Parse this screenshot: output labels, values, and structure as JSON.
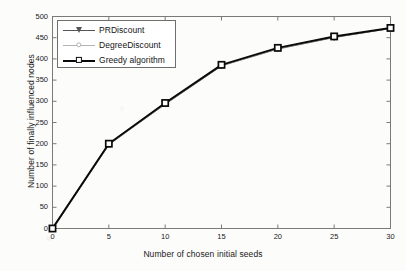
{
  "chart_data": {
    "type": "line",
    "title": "",
    "xlabel": "Number of chosen initial seeds",
    "ylabel": "Number of finally influenced nodes",
    "x": [
      0,
      5,
      10,
      15,
      20,
      25,
      30
    ],
    "xlim": [
      0,
      30
    ],
    "ylim": [
      0,
      500
    ],
    "xticks": [
      "0",
      "5",
      "10",
      "15",
      "20",
      "25",
      "30"
    ],
    "yticks": [
      "0",
      "50",
      "100",
      "150",
      "200",
      "250",
      "300",
      "350",
      "400",
      "450",
      "500"
    ],
    "grid": false,
    "legend_position": "upper-left",
    "series": [
      {
        "name": "PRDiscount",
        "marker": "triangle-down",
        "color": "#555555",
        "values": [
          0,
          199,
          294,
          384,
          424,
          451,
          472
        ]
      },
      {
        "name": "DegreeDiscount",
        "marker": "circle",
        "color": "#b3b3b3",
        "values": [
          0,
          198,
          295,
          385,
          425,
          452,
          472
        ]
      },
      {
        "name": "Greedy algorithm",
        "marker": "square",
        "color": "#0a0a0a",
        "values": [
          0,
          200,
          296,
          386,
          426,
          453,
          473
        ]
      }
    ]
  },
  "axes": {
    "frame_color": "#7a7a7a",
    "tick_color": "#7a7a7a"
  },
  "legend": {
    "entries": [
      {
        "label": "PRDiscount",
        "marker": "triangle-down-icon"
      },
      {
        "label": "DegreeDiscount",
        "marker": "circle-icon"
      },
      {
        "label": "Greedy algorithm",
        "marker": "square-icon"
      }
    ]
  }
}
